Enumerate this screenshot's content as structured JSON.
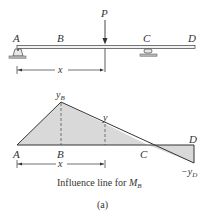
{
  "beam": {
    "points": {
      "A": "A",
      "B": "B",
      "C": "C",
      "D": "D"
    },
    "load_label": "P",
    "dimension_label": "x",
    "supports": [
      "pin at A",
      "roller at C"
    ]
  },
  "influence_line": {
    "points": {
      "A": "A",
      "B": "B",
      "C": "C",
      "D": "D"
    },
    "peak_label": "y",
    "peak_subscript": "B",
    "ordinate_label": "y",
    "end_label": "−y",
    "end_subscript": "D",
    "dimension_label": "x",
    "fill_color": "#d9d9d9",
    "line_color": "#333333"
  },
  "caption": {
    "text": "Influence line for ",
    "symbol": "M",
    "symbol_subscript": "B",
    "figure_label": "(a)"
  }
}
